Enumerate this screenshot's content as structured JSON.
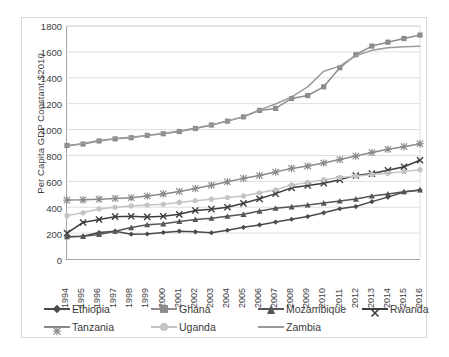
{
  "chart_data": {
    "type": "line",
    "title": "",
    "xlabel": "",
    "ylabel": "Per Capita GDP Constant $2010",
    "ylim": [
      0,
      1800
    ],
    "ytick_step": 200,
    "yticks": [
      1800,
      1600,
      1400,
      1200,
      1000,
      800,
      600,
      400,
      200,
      0
    ],
    "grid": "horizontal",
    "legend_position": "bottom",
    "categories": [
      1994,
      1995,
      1996,
      1997,
      1998,
      1999,
      2000,
      2001,
      2002,
      2003,
      2004,
      2005,
      2006,
      2007,
      2008,
      2009,
      2010,
      2011,
      2012,
      2013,
      2014,
      2015,
      2016
    ],
    "series": [
      {
        "name": "Ethiopia",
        "marker": "diamond",
        "color": "#4a4a4a",
        "values": [
          170,
          175,
          205,
          215,
          192,
          193,
          205,
          215,
          210,
          203,
          222,
          245,
          263,
          285,
          307,
          328,
          357,
          388,
          405,
          443,
          478,
          517,
          533
        ]
      },
      {
        "name": "Ghana",
        "marker": "square",
        "color": "#8c8c8c",
        "values": [
          877,
          888,
          912,
          928,
          937,
          955,
          968,
          985,
          1008,
          1035,
          1065,
          1098,
          1148,
          1163,
          1240,
          1263,
          1330,
          1477,
          1578,
          1645,
          1675,
          1703,
          1730
        ]
      },
      {
        "name": "Mozambique",
        "marker": "triangle",
        "color": "#555555",
        "values": [
          173,
          175,
          190,
          215,
          243,
          265,
          272,
          290,
          305,
          315,
          330,
          345,
          370,
          392,
          403,
          418,
          432,
          448,
          463,
          487,
          503,
          520,
          533
        ]
      },
      {
        "name": "Rwanda",
        "marker": "cross",
        "color": "#3d3d3d",
        "values": [
          200,
          282,
          305,
          327,
          330,
          325,
          330,
          345,
          375,
          385,
          400,
          430,
          465,
          505,
          550,
          568,
          585,
          613,
          645,
          660,
          685,
          713,
          763
        ]
      },
      {
        "name": "Tanzania",
        "marker": "asterisk",
        "color": "#8a8a8a",
        "values": [
          455,
          457,
          462,
          468,
          473,
          487,
          503,
          522,
          545,
          570,
          597,
          623,
          645,
          672,
          700,
          718,
          742,
          768,
          795,
          822,
          848,
          868,
          890
        ]
      },
      {
        "name": "Uganda",
        "marker": "circle",
        "color": "#c4c4c4",
        "values": [
          335,
          357,
          387,
          400,
          410,
          417,
          423,
          437,
          450,
          462,
          475,
          487,
          512,
          535,
          572,
          592,
          613,
          630,
          640,
          652,
          662,
          675,
          690
        ]
      },
      {
        "name": "Zambia",
        "marker": "none",
        "color": "#9a9a9a",
        "values": [
          873,
          893,
          915,
          930,
          940,
          955,
          970,
          988,
          1010,
          1035,
          1067,
          1100,
          1152,
          1197,
          1253,
          1330,
          1450,
          1490,
          1570,
          1612,
          1632,
          1640,
          1643
        ]
      }
    ]
  },
  "legend": {
    "row1": [
      {
        "label": "Ethiopia",
        "marker": "diamond",
        "color": "#4a4a4a"
      },
      {
        "label": "Ghana",
        "marker": "square",
        "color": "#8c8c8c"
      },
      {
        "label": "Mozambique",
        "marker": "triangle",
        "color": "#555555"
      },
      {
        "label": "Rwanda",
        "marker": "cross",
        "color": "#3d3d3d"
      }
    ],
    "row2": [
      {
        "label": "Tanzania",
        "marker": "asterisk",
        "color": "#8a8a8a"
      },
      {
        "label": "Uganda",
        "marker": "circle",
        "color": "#c4c4c4"
      },
      {
        "label": "Zambia",
        "marker": "none",
        "color": "#9a9a9a"
      }
    ]
  },
  "caption": ""
}
